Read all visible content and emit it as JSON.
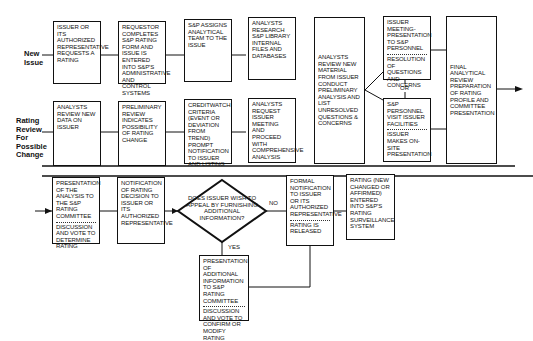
{
  "row_labels": {
    "new_issue": [
      "New",
      "Issue"
    ],
    "rating_review": [
      "Rating",
      "Review",
      "For",
      "Possible",
      "Change"
    ]
  },
  "top_row": {
    "issuer_requests": "Issuer or its authorized representative requests a rating",
    "requestor_completes": "Requestor completes S&P rating form and issue is entered into S&P's administrative and control systems",
    "assigns_team": "S&P assigns analytical team to the issue",
    "analysts_research": "Analysts research S&P library internal files and databases",
    "analysts_review_material": "Analysts review new material from issuer conduct preliminary analysis and list unresolved questions & concerns",
    "issuer_meeting": {
      "top": "Issuer meeting-presentation to S&P personnel",
      "bottom": "Resolution of questions and concerns"
    },
    "or_label": "OR",
    "visit_facilities": {
      "top": "S&P personnel visit issuer facilities",
      "bottom": "Issuer makes on-site presentation"
    },
    "final_review": "Final analytical review preparation of rating profile and committee presentation"
  },
  "middle_row": {
    "analysts_review_data": "Analysts review new data on issuer",
    "preliminary_review": "Preliminary review indicates possibility of rating change",
    "creditwatch": "Creditwatch criteria (event or deviation from trend) prompt notification to issuer and listing",
    "analysts_request_meeting": "Analysts request issuer meeting and proceed with comprehensive analysis"
  },
  "bottom_row": {
    "presentation_committee": {
      "top": "Presentation of the analysis to the S&P rating committee",
      "bottom": "Discussion and vote to determine rating"
    },
    "notification": "Notification of rating decision to issuer or its authorized representative",
    "decision": "Does issuer wish to appeal by furnishing additional information?",
    "no_label": "NO",
    "yes_label": "YES",
    "formal_notification": {
      "top": "Formal notification to issuer or its authorized representative",
      "bottom": "Rating is released"
    },
    "rating_entered": "Rating (new changed or affirmed) entered into S&P's rating surveillance system",
    "additional_info": {
      "top": "Presentation of additional information to S&P rating committee",
      "bottom": "Discussion and vote to confirm or modify rating"
    }
  }
}
